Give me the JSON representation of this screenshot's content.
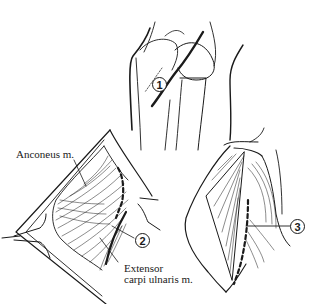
{
  "figure": {
    "panels": [
      {
        "id": "top",
        "description": "Elbow joint with incision line",
        "callout": "1"
      },
      {
        "id": "bottom-left",
        "description": "Exposed muscles with dashed incision",
        "callout": "2"
      },
      {
        "id": "bottom-right",
        "description": "Deep dissection with dashed incision",
        "callout": "3"
      }
    ],
    "labels": {
      "anconeus": "Anconeus m.",
      "ecu_line1": "Extensor",
      "ecu_line2": "carpi ulnaris m."
    },
    "colors": {
      "ink": "#1a1a1a",
      "paper": "#ffffff"
    }
  }
}
